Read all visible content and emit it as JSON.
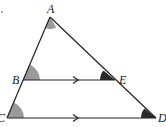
{
  "diagram": {
    "points": {
      "A": {
        "label": "A",
        "x": 50,
        "y": 17
      },
      "B": {
        "label": "B",
        "x": 23,
        "y": 80
      },
      "C": {
        "label": "C",
        "x": 7,
        "y": 118
      },
      "D": {
        "label": "D",
        "x": 156,
        "y": 118
      },
      "E": {
        "label": "E",
        "x": 115,
        "y": 80
      }
    },
    "segments": [
      "AC",
      "AD",
      "BE",
      "CD"
    ],
    "parallel_marks": [
      "BE",
      "CD"
    ],
    "angle_marks": [
      {
        "vertex": "A",
        "shade": "light"
      },
      {
        "vertex": "B",
        "shade": "light"
      },
      {
        "vertex": "C",
        "shade": "light"
      },
      {
        "vertex": "E",
        "shade": "dark"
      },
      {
        "vertex": "D",
        "shade": "dark"
      }
    ],
    "colors": {
      "line": "#222222",
      "light_angle": "#9a9a9a",
      "dark_angle": "#2a2a2a"
    }
  }
}
